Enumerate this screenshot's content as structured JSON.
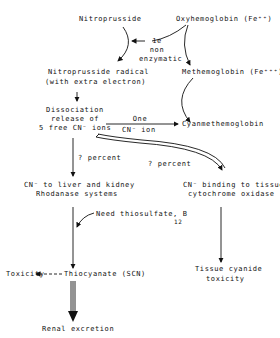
{
  "nodes": {
    "nitroprusside": "Nitroprusside",
    "oxyhemoglobin": "Oxyhemoglobin (Fe⁺⁺)",
    "electron_label_1": "1e",
    "electron_label_2": "non",
    "electron_label_3": "enzymatic",
    "radical_1": "Nitroprusside radical",
    "radical_2": "(with extra electron)",
    "methemoglobin": "Methemoglobin (Fe⁺⁺⁺)",
    "dissociation_1": "Dissociation",
    "dissociation_2": "release of",
    "dissociation_3": "5 free CN⁻ ions",
    "one_cn_1": "One",
    "one_cn_2": "CN⁻ ion",
    "cyanmethemoglobin": "Cyanmethemoglobin",
    "percent_left": "? percent",
    "percent_right": "? percent",
    "liver_1": "CN⁻ to liver and kidney",
    "liver_2": "Rhodanase systems",
    "tissue_binding_1": "CN⁻ binding to tissue",
    "tissue_binding_2": "cytochrome oxidase",
    "need_thiosulfate": "Need thiosulfate, B",
    "need_sub": "12",
    "toxicity": "Toxicity",
    "thiocyanate": "Thiocyanate (SCN)",
    "tissue_toxicity_1": "Tissue cyanide",
    "tissue_toxicity_2": "toxicity",
    "renal": "Renal excretion"
  }
}
